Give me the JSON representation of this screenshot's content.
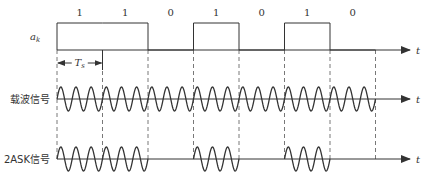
{
  "bits": [
    "1",
    "1",
    "0",
    "1",
    "0",
    "1",
    "0"
  ],
  "labels": {
    "ak": "a",
    "ak_sub": "k",
    "carrier": "载波信号",
    "ask": "2ASK信号",
    "ts": "T",
    "ts_sub": "s",
    "t_axis": "t"
  },
  "geometry": {
    "x0": 57,
    "bit_width": 45.5,
    "axis_end": 410,
    "ak_base_y": 50,
    "ak_high_y": 23,
    "carrier_y": 99,
    "ask_y": 159,
    "amplitude": 12,
    "cycles_per_bit": 3
  },
  "colors": {
    "line": "#333333",
    "dashed": "#555555"
  }
}
